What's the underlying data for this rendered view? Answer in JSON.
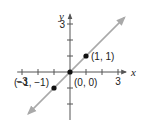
{
  "chart_data": {
    "type": "line",
    "title": "",
    "xlabel": "x",
    "ylabel": "y",
    "xlim": [
      -3.3,
      3.5
    ],
    "ylim": [
      -3,
      3.6
    ],
    "x_ticks": [
      -3,
      -2,
      -1,
      1,
      2,
      3
    ],
    "y_ticks": [
      -2,
      -1,
      1,
      2,
      3
    ],
    "x_tick_labels": [
      {
        "value": -3,
        "label": "−3"
      },
      {
        "value": 3,
        "label": "3"
      }
    ],
    "y_tick_labels": [
      {
        "value": 3,
        "label": "3"
      }
    ],
    "grid": false,
    "series": [
      {
        "name": "y = x",
        "x": [
          -2.6,
          3.4
        ],
        "y": [
          -2.6,
          3.4
        ],
        "style": "line-with-arrows",
        "color": "#a9a9a9"
      }
    ],
    "points": [
      {
        "x": -1,
        "y": -1,
        "label": "(−1, −1)",
        "label_position": "left"
      },
      {
        "x": 0,
        "y": 0,
        "label": "(0, 0)",
        "label_position": "below-right"
      },
      {
        "x": 1,
        "y": 1,
        "label": "(1, 1)",
        "label_position": "right"
      }
    ],
    "colors": {
      "axis": "#555555",
      "line": "#a9a9a9",
      "point": "#111111"
    }
  }
}
